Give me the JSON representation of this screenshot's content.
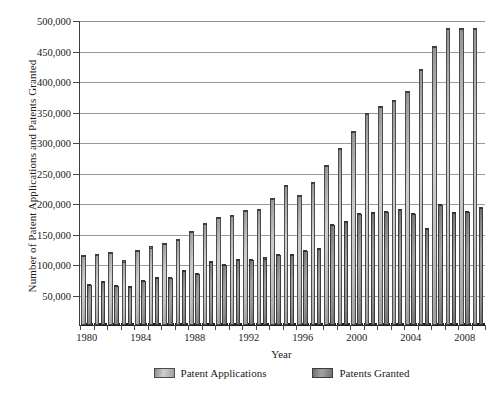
{
  "chart_data": {
    "type": "bar",
    "title": "",
    "xlabel": "Year",
    "ylabel": "Number of Patent Applications and Patents Granted",
    "ylim": [
      0,
      500000
    ],
    "ytick_values": [
      50000,
      100000,
      150000,
      200000,
      250000,
      300000,
      350000,
      400000,
      450000,
      500000
    ],
    "ytick_labels": [
      "50,000",
      "100,000",
      "150,000",
      "200,000",
      "250,000",
      "300,000",
      "350,000",
      "400,000",
      "450,000",
      "500,000"
    ],
    "grid": true,
    "legend_position": "bottom",
    "categories": [
      1980,
      1981,
      1982,
      1983,
      1984,
      1985,
      1986,
      1987,
      1988,
      1989,
      1990,
      1991,
      1992,
      1993,
      1994,
      1995,
      1996,
      1997,
      1998,
      1999,
      2000,
      2001,
      2002,
      2003,
      2004,
      2005,
      2006,
      2007,
      2008,
      2009
    ],
    "xtick_labels": [
      "1980",
      "1984",
      "1988",
      "1992",
      "1996",
      "2000",
      "2004",
      "2008"
    ],
    "series": [
      {
        "name": "Patent Applications",
        "color": "#bdbdbd",
        "values": [
          113000,
          114000,
          118000,
          104000,
          121000,
          127000,
          133000,
          140000,
          152000,
          166000,
          176000,
          178000,
          187000,
          189000,
          207000,
          228000,
          212000,
          233000,
          261000,
          289000,
          316000,
          346000,
          357000,
          367000,
          382000,
          418000,
          455000,
          485000,
          485000,
          485000
        ]
      },
      {
        "name": "Patents Granted",
        "color": "#8d8d8d",
        "values": [
          66000,
          71000,
          64000,
          62000,
          72000,
          77000,
          77000,
          89000,
          84000,
          103000,
          99000,
          107000,
          107000,
          109000,
          114000,
          114000,
          122000,
          125000,
          164000,
          169000,
          182000,
          184000,
          185000,
          188000,
          182000,
          157000,
          196000,
          184000,
          185000,
          192000
        ]
      }
    ]
  },
  "legend": {
    "items": [
      {
        "label": "Patent Applications",
        "key": "app"
      },
      {
        "label": "Patents Granted",
        "key": "grant"
      }
    ]
  }
}
